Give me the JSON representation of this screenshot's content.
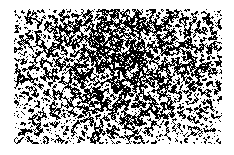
{
  "canvas": {
    "width": 234,
    "height": 155,
    "background_color": "#ffffff",
    "description": "Binary noise texture patch on white background"
  },
  "texture": {
    "name": "binary-noise-patch",
    "type": "random-dither-speckle",
    "x": 14,
    "y": 9,
    "width": 208,
    "height": 135,
    "foreground_color": "#000000",
    "background_color": "#ffffff",
    "grain_px": 1,
    "base_coverage": 0.4,
    "density_map": {
      "center_x_fraction": 0.52,
      "center_y_fraction": 0.36,
      "center_coverage": 0.47,
      "edge_coverage": 0.26,
      "falloff": 1.15
    },
    "clump_passes": 2,
    "seed": 20240517
  },
  "caption": {
    "text": ""
  }
}
